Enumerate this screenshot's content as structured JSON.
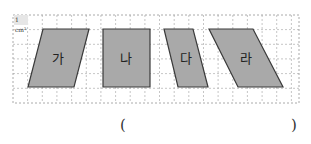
{
  "grid": {
    "unit_label": "1 cm²",
    "origin": [
      13,
      15
    ],
    "cell_px": 14.65,
    "width_px": 286,
    "height_px": 88,
    "line_color": "#b8b8b8",
    "border_color": "#a0a0a0"
  },
  "shapes": [
    {
      "id": "ga",
      "label": "가",
      "points": "43,29 89,29 74,87 28,87",
      "center": [
        58,
        58
      ]
    },
    {
      "id": "na",
      "label": "나",
      "points": "103,29 150,29 150,87 103,87",
      "center": [
        126,
        58
      ]
    },
    {
      "id": "da",
      "label": "다",
      "points": "164,29 193,29 208,87 178,87",
      "center": [
        186,
        58
      ]
    },
    {
      "id": "ra",
      "label": "라",
      "points": "209,29 253,29 283,87 238,87",
      "center": [
        246,
        58
      ]
    }
  ],
  "shape_style": {
    "fill": "#a9a9a9",
    "stroke": "#3a3a3a"
  },
  "answer": {
    "open_paren": "(",
    "close_paren": ")",
    "value": ""
  }
}
